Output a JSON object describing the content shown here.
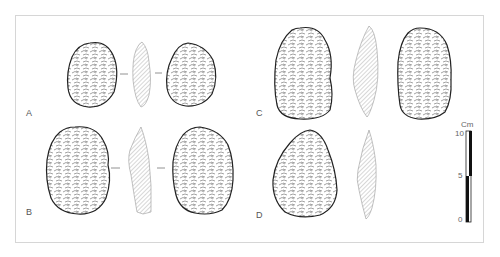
{
  "figure": {
    "artifacts": [
      {
        "id": "A",
        "label": "A",
        "views": [
          "dorsal",
          "section",
          "ventral"
        ]
      },
      {
        "id": "B",
        "label": "B",
        "views": [
          "dorsal",
          "section",
          "ventral"
        ]
      },
      {
        "id": "C",
        "label": "C",
        "views": [
          "dorsal",
          "section",
          "ventral"
        ]
      },
      {
        "id": "D",
        "label": "D",
        "views": [
          "dorsal",
          "section"
        ]
      }
    ],
    "scale_bar": {
      "unit": "Cm",
      "ticks": [
        "10",
        "5",
        "0"
      ]
    },
    "colors": {
      "line": "#333333",
      "hatch": "#9a9a9a",
      "frame": "#d6d6d6",
      "scale_fill": "#111111"
    }
  }
}
